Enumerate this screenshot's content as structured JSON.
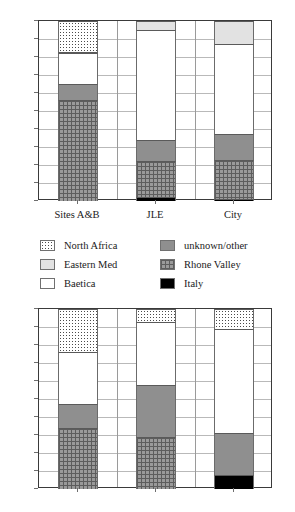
{
  "chart_data": [
    {
      "id": "top-chart",
      "type": "bar",
      "stacked": true,
      "title": "",
      "xlabel": "",
      "ylabel": "%",
      "ylim": [
        0,
        100
      ],
      "yticks": [
        "100",
        "90",
        "80",
        "70",
        "60",
        "50",
        "40",
        "30",
        "20",
        "10",
        "%"
      ],
      "ytick_values": [
        100,
        90,
        80,
        70,
        60,
        50,
        40,
        30,
        20,
        10,
        0
      ],
      "grid": true,
      "legend": "below",
      "categories": [
        "Sites A&B",
        "JLE",
        "City"
      ],
      "series": [
        {
          "name": "Italy",
          "key": "italy",
          "values": [
            0,
            2,
            1
          ]
        },
        {
          "name": "Rhone Valley",
          "key": "rhone",
          "values": [
            56,
            20,
            22
          ]
        },
        {
          "name": "unknown/other",
          "key": "unknown",
          "values": [
            9,
            12,
            14
          ]
        },
        {
          "name": "Baetica",
          "key": "baetica",
          "values": [
            17,
            61,
            50
          ]
        },
        {
          "name": "Eastern Med",
          "key": "eastern",
          "values": [
            1,
            5,
            13
          ]
        },
        {
          "name": "North Africa",
          "key": "north",
          "values": [
            17,
            0,
            0
          ]
        }
      ]
    },
    {
      "id": "bottom-chart",
      "type": "bar",
      "stacked": true,
      "title": "",
      "xlabel": "",
      "ylabel": "%",
      "ylim": [
        0,
        100
      ],
      "yticks": [
        "100",
        "90",
        "80",
        "70",
        "60",
        "50",
        "40",
        "30",
        "20",
        "10",
        "%"
      ],
      "ytick_values": [
        100,
        90,
        80,
        70,
        60,
        50,
        40,
        30,
        20,
        10,
        0
      ],
      "grid": true,
      "legend": "none",
      "categories": [
        "",
        "",
        ""
      ],
      "series": [
        {
          "name": "Italy",
          "key": "italy",
          "values": [
            0,
            0,
            8
          ]
        },
        {
          "name": "Rhone Valley",
          "key": "rhone",
          "values": [
            34,
            29,
            0
          ]
        },
        {
          "name": "unknown/other",
          "key": "unknown",
          "values": [
            13,
            29,
            23
          ]
        },
        {
          "name": "Baetica",
          "key": "baetica",
          "values": [
            29,
            35,
            58
          ]
        },
        {
          "name": "Eastern Med",
          "key": "eastern",
          "values": [
            0,
            0,
            0
          ]
        },
        {
          "name": "North Africa",
          "key": "north",
          "values": [
            24,
            7,
            11
          ]
        }
      ]
    }
  ],
  "legend": {
    "items": [
      {
        "label": "North Africa",
        "key": "north",
        "color": "#ffffff",
        "pattern": "dotted"
      },
      {
        "label": "unknown/other",
        "key": "unknown",
        "color": "#8f8f8f",
        "pattern": "solid"
      },
      {
        "label": "Eastern Med",
        "key": "eastern",
        "color": "#e2e2e2",
        "pattern": "solid"
      },
      {
        "label": "Rhone Valley",
        "key": "rhone",
        "color": "#9a9a9a",
        "pattern": "crosshatch"
      },
      {
        "label": "Baetica",
        "key": "baetica",
        "color": "#ffffff",
        "pattern": "solid"
      },
      {
        "label": "Italy",
        "key": "italy",
        "color": "#000000",
        "pattern": "solid"
      }
    ]
  }
}
